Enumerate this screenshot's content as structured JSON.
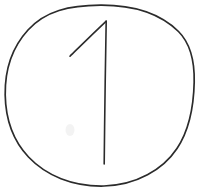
{
  "canvas": {
    "width": 202,
    "height": 193,
    "background_color": "#ffffff",
    "description": "Hand-drawn sketch of the numeral 1 enclosed in a hand-drawn circle",
    "medium": "pen-on-paper line drawing"
  },
  "ink": {
    "stroke_color": "#2b2b2b",
    "circle_stroke_width": 1.7,
    "digit_stroke_width": 1.6,
    "smudge_color": "#e9e9e9"
  },
  "shapes": {
    "enclosure": {
      "name": "hand-drawn circle",
      "type": "ellipse",
      "center_x": 100,
      "center_y": 95.5,
      "radius_x": 94.5,
      "radius_y": 90.5,
      "left_edge_x": 5,
      "right_edge_x": 194,
      "top_edge_y": 5,
      "bottom_edge_y": 186,
      "path": "M 100.5 5.2 C 133 5.0 160.5 14.0 178.5 31.5 C 191.5 44.5 194.6 62.5 194.2 82.0 C 193.7 106.0 190.0 129.0 177.0 148.5 C 163.0 169.5 136.5 185.2 104.0 186.0 C 72.5 186.7 46.0 175.5 28.5 157.0 C 12.5 140.0 5.6 118.0 5.2 95.0 C 4.8 70.5 12.0 47.5 28.0 30.0 C 45.5 11.0 69.0 5.4 100.5 5.2 Z"
    },
    "digit": {
      "name": "numeral one",
      "character": "1",
      "stem_path": "M 106.2 21.0 C 105.6 52.0 105.0 94.0 104.6 128.0 C 104.4 146.0 104.3 156.5 104.2 164.0",
      "flag_path": "M 106.0 21.4 C 97.5 29.5 86.5 40.0 78.5 47.8 C 74.5 51.7 71.8 54.3 70.0 56.2",
      "apex_x": 106,
      "apex_y": 21,
      "stem_bottom_x": 104,
      "stem_bottom_y": 164,
      "flag_end_x": 70,
      "flag_end_y": 56
    },
    "smudge": {
      "name": "faint paper smudge",
      "center_x": 70,
      "center_y": 130,
      "radius_x": 4.5,
      "radius_y": 6
    }
  }
}
